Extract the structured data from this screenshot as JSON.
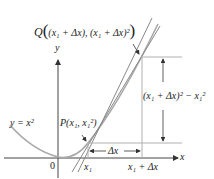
{
  "diagram": {
    "colors": {
      "curve": "#a8a8a8",
      "secant": "#888888",
      "axis": "#444444",
      "guide": "#b0b0b0",
      "arrow": "#333333",
      "text": "#222222"
    },
    "labels": {
      "q_point_prefix": "Q",
      "q_point_coords": "(x₁ + Δx), (x₁ + Δx)²",
      "y_axis": "y",
      "x_axis": "x",
      "curve_eq": "y = x²",
      "p_point": "P(x₁, x₁²)",
      "origin": "0",
      "x1": "x₁",
      "x1_plus_dx": "x₁ + Δx",
      "delta_x": "Δx",
      "delta_y": "(x₁ + Δx)² − x₁²"
    }
  }
}
